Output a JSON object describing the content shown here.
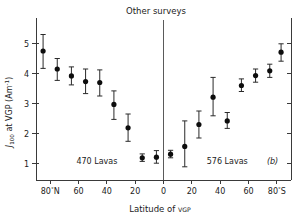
{
  "figure": {
    "title": "Other surveys",
    "panel_label": "(b)"
  },
  "axes": {
    "y_title_main": "J",
    "y_title_sub": "100",
    "y_title_rest": " at VGP (Am",
    "y_title_sup": "-1",
    "y_title_end": ")",
    "y_title_full": "J100 at VGP (Am-1)",
    "x_title": "Latitude of VGP",
    "x_title_main": "Latitude of ",
    "x_title_small": "VGP"
  },
  "chart_data": {
    "type": "scatter",
    "title": "Other surveys",
    "xlabel": "Latitude of VGP",
    "ylabel": "J100 at VGP (Am-1)",
    "xlim": [
      90,
      -90
    ],
    "ylim": [
      0.45,
      5.65
    ],
    "grid": false,
    "legend": false,
    "error_bars": "vertical",
    "x_tick_values": [
      80,
      60,
      40,
      20,
      0,
      -20,
      -40,
      -60,
      -80
    ],
    "x_tick_labels": [
      "80°N",
      "60",
      "40",
      "20",
      "0",
      "20",
      "40",
      "60",
      "80°S"
    ],
    "y_tick_values": [
      1,
      2,
      3,
      4,
      5
    ],
    "y_tick_labels": [
      "1",
      "2",
      "3",
      "4",
      "5"
    ],
    "annotations": [
      {
        "text": "470 Lavas",
        "x": 47,
        "y": 1.0
      },
      {
        "text": "576 Lavas",
        "x": -45,
        "y": 1.0
      },
      {
        "text": "(b)",
        "x": -77,
        "y": 1.0
      }
    ],
    "series": [
      {
        "name": "470 Lavas",
        "hemisphere": "North",
        "points": [
          {
            "x": 85,
            "y": 4.75,
            "yerr_low": 0.58,
            "yerr_high": 0.55
          },
          {
            "x": 75,
            "y": 4.15,
            "yerr_low": 0.38,
            "yerr_high": 0.35
          },
          {
            "x": 65,
            "y": 3.92,
            "yerr_low": 0.3,
            "yerr_high": 0.3
          },
          {
            "x": 55,
            "y": 3.73,
            "yerr_low": 0.4,
            "yerr_high": 0.42
          },
          {
            "x": 45,
            "y": 3.7,
            "yerr_low": 0.45,
            "yerr_high": 0.42
          },
          {
            "x": 35,
            "y": 2.97,
            "yerr_low": 0.5,
            "yerr_high": 0.45
          },
          {
            "x": 25,
            "y": 2.19,
            "yerr_low": 0.45,
            "yerr_high": 0.46
          },
          {
            "x": 15,
            "y": 1.19,
            "yerr_low": 0.12,
            "yerr_high": 0.13
          },
          {
            "x": 5,
            "y": 1.21,
            "yerr_low": 0.2,
            "yerr_high": 0.22
          }
        ]
      },
      {
        "name": "576 Lavas",
        "hemisphere": "South",
        "points": [
          {
            "x": -5,
            "y": 1.31,
            "yerr_low": 0.12,
            "yerr_high": 0.13
          },
          {
            "x": -15,
            "y": 1.57,
            "yerr_low": 0.68,
            "yerr_high": 0.85
          },
          {
            "x": -25,
            "y": 2.3,
            "yerr_low": 0.45,
            "yerr_high": 0.45
          },
          {
            "x": -35,
            "y": 3.21,
            "yerr_low": 0.62,
            "yerr_high": 0.66
          },
          {
            "x": -45,
            "y": 2.42,
            "yerr_low": 0.25,
            "yerr_high": 0.28
          },
          {
            "x": -55,
            "y": 3.6,
            "yerr_low": 0.2,
            "yerr_high": 0.22
          },
          {
            "x": -65,
            "y": 3.93,
            "yerr_low": 0.22,
            "yerr_high": 0.22
          },
          {
            "x": -75,
            "y": 4.09,
            "yerr_low": 0.22,
            "yerr_high": 0.22
          },
          {
            "x": -83,
            "y": 4.71,
            "yerr_low": 0.3,
            "yerr_high": 0.28
          }
        ]
      }
    ]
  },
  "colors": {
    "marker": "#0d0d0d",
    "error_bar": "#2a2a2a",
    "axis": "#3a3a3a",
    "divider": "#5a5a5a",
    "text": "#1b1b1b",
    "background": "#ffffff"
  }
}
